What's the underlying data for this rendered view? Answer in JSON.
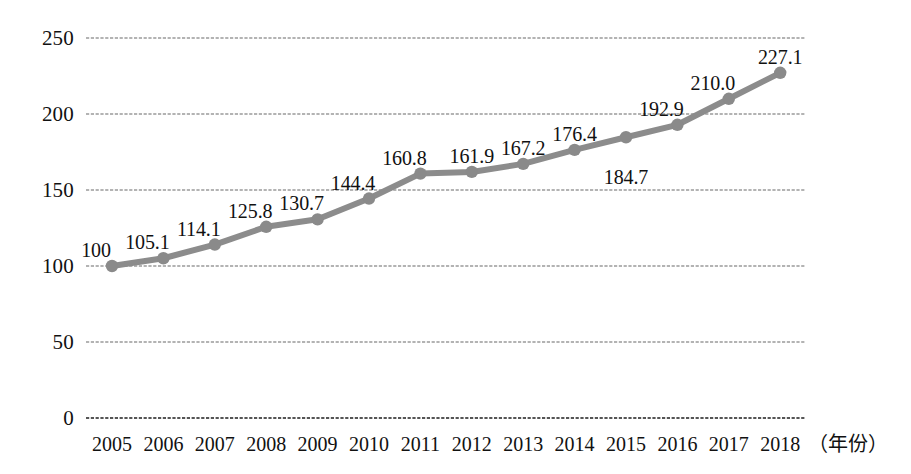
{
  "chart_data": {
    "type": "line",
    "title": "",
    "subtitle": "",
    "xlabel": "（年份）",
    "ylabel": "",
    "grid": true,
    "legend": null,
    "legend_position": "none",
    "ylim": [
      0,
      250
    ],
    "yticks": [
      "0",
      "50",
      "100",
      "150",
      "200",
      "250"
    ],
    "ytick_values": [
      0,
      50,
      100,
      150,
      200,
      250
    ],
    "categories": [
      "2005",
      "2006",
      "2007",
      "2008",
      "2009",
      "2010",
      "2011",
      "2012",
      "2013",
      "2014",
      "2015",
      "2016",
      "2017",
      "2018"
    ],
    "values": [
      100,
      105.1,
      114.1,
      125.8,
      130.7,
      144.4,
      160.8,
      161.9,
      167.2,
      176.4,
      184.7,
      192.9,
      210.0,
      227.1
    ],
    "point_labels": [
      "100",
      "105.1",
      "114.1",
      "125.8",
      "130.7",
      "144.4",
      "160.8",
      "161.9",
      "167.2",
      "176.4",
      "184.7",
      "192.9",
      "210.0",
      "227.1"
    ],
    "point_label_placement": [
      "above-left",
      "above-left",
      "above-left",
      "above-left",
      "above-left",
      "above-left",
      "above-left",
      "above",
      "above",
      "above",
      "below",
      "above-left",
      "above-left",
      "above"
    ],
    "series": [
      {
        "name": "指数",
        "values": [
          100,
          105.1,
          114.1,
          125.8,
          130.7,
          144.4,
          160.8,
          161.9,
          167.2,
          176.4,
          184.7,
          192.9,
          210.0,
          227.1
        ]
      }
    ],
    "colors": {
      "line": "#8c8c8c",
      "marker": "#8a8a8a",
      "grid": "#9a9a9a",
      "axis": "#555555",
      "text": "#111111",
      "background": "#ffffff"
    }
  }
}
